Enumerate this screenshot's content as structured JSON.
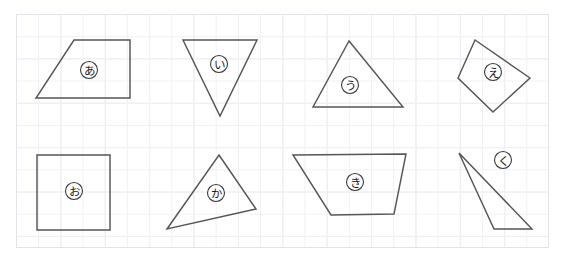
{
  "worksheet": {
    "title": "Geometry shapes worksheet on grid paper",
    "canvas": {
      "width": 564,
      "height": 261
    },
    "background_color": "#ffffff",
    "grid": {
      "visible": true,
      "left": 16,
      "top": 14,
      "width": 533,
      "height": 234,
      "major_spacing": 44.4,
      "minor_spacing": 22.2,
      "major_color": "#e7e9ef",
      "minor_color": "#f0f1f5",
      "border_color": "#e2e4ea"
    },
    "stroke_color": "#565656",
    "label_circle_stroke": "#3a3a3a",
    "label_text_color": "#1b1b1b"
  },
  "shapes": [
    {
      "id": "shape-a",
      "label": "あ",
      "kind": "trapezoid",
      "points": "74,40 130,40 130,98 36,98",
      "label_x": 89,
      "label_y": 70,
      "label_r": 8.5
    },
    {
      "id": "shape-i",
      "label": "い",
      "kind": "inverted-triangle",
      "points": "183,40 257,40 220,116",
      "label_x": 219,
      "label_y": 64,
      "label_r": 8.5
    },
    {
      "id": "shape-u",
      "label": "う",
      "kind": "triangle",
      "points": "349,41 403,107 313,107",
      "label_x": 350,
      "label_y": 85,
      "label_r": 8.5
    },
    {
      "id": "shape-e",
      "label": "え",
      "kind": "quadrilateral",
      "points": "475,40 530,78 493,112 458,78",
      "label_x": 493,
      "label_y": 72,
      "label_r": 8.5
    },
    {
      "id": "shape-o",
      "label": "お",
      "kind": "square",
      "points": "37,155 110,155 110,230 37,230",
      "label_x": 74,
      "label_y": 191,
      "label_r": 8.5
    },
    {
      "id": "shape-ka",
      "label": "か",
      "kind": "triangle",
      "points": "219,155 256,209 167,229",
      "label_x": 216,
      "label_y": 193,
      "label_r": 8.5
    },
    {
      "id": "shape-ki",
      "label": "き",
      "kind": "trapezoid",
      "points": "293,155 406,154 394,214 331,215",
      "label_x": 355,
      "label_y": 182,
      "label_r": 8.5
    },
    {
      "id": "shape-ku",
      "label": "く",
      "kind": "thin-triangle",
      "points": "459,153 532,229 494,229",
      "label_x": 503,
      "label_y": 160,
      "label_r": 8.5
    }
  ]
}
